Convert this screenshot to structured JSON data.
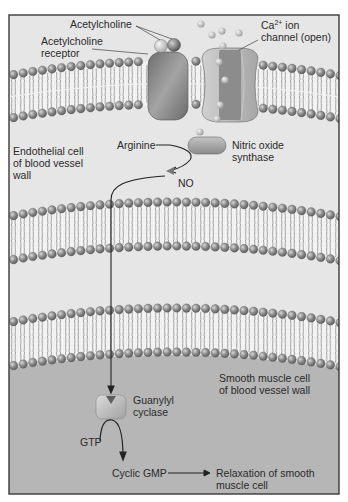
{
  "labels": {
    "acetylcholine": "Acetylcholine",
    "acetylcholine_receptor_line1": "Acetylcholine",
    "acetylcholine_receptor_line2": "receptor",
    "ca_channel_prefix": "Ca",
    "ca_channel_sup": "2+",
    "ca_channel_suffix": " ion",
    "ca_channel_line2": "channel (open)",
    "arginine": "Arginine",
    "nos_line1": "Nitric oxide",
    "nos_line2": "synthase",
    "endothelial_line1": "Endothelial cell",
    "endothelial_line2": "of blood vessel",
    "endothelial_line3": "wall",
    "no": "NO",
    "smooth_muscle_line1": "Smooth muscle cell",
    "smooth_muscle_line2": "of blood vessel wall",
    "guanylyl_line1": "Guanylyl",
    "guanylyl_line2": "cyclase",
    "gtp": "GTP",
    "cyclic_gmp": "Cyclic GMP",
    "relaxation_line1": "Relaxation of smooth",
    "relaxation_line2": "muscle cell"
  },
  "colors": {
    "frame_border": "#3a3a3a",
    "endothelial_bg": "#e4e4e4",
    "interstitial_bg": "#e8e8e8",
    "smooth_muscle_bg": "#b4b4b4",
    "membrane_core": "#f2f2f2",
    "lipid_head": "#8a8a8a",
    "lipid_tail": "#9a9a9a",
    "receptor": "#8c8c8c",
    "channel": "#b0b0b0",
    "enzyme": "#a8a8a8",
    "arrow": "#222222"
  }
}
